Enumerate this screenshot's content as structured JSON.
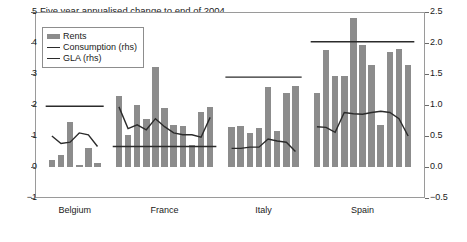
{
  "chart_data": {
    "type": "bar",
    "title": "Five year annualised change to end of 2004",
    "xlabel": "",
    "ylabel": "",
    "ylim": [
      -1,
      5
    ],
    "y2lim": [
      -0.5,
      2.5
    ],
    "yticks": [
      "5",
      "4",
      "3",
      "2",
      "1",
      "0",
      "-1"
    ],
    "ytick_values": [
      5,
      4,
      3,
      2,
      1,
      0,
      -1
    ],
    "y2ticks": [
      "2.5",
      "2.0",
      "1.5",
      "1.0",
      "0.5",
      "0.0",
      "-0.5"
    ],
    "y2tick_values": [
      2.5,
      2.0,
      1.5,
      1.0,
      0.5,
      0.0,
      -0.5
    ],
    "grid": false,
    "legend_position": "top-left",
    "legend": [
      {
        "label": "Rents",
        "type": "bar",
        "color": "#8c8c8c"
      },
      {
        "label": "Consumption (rhs)",
        "type": "line",
        "color": "#2b2b2b"
      },
      {
        "label": "GLA (rhs)",
        "type": "line",
        "color": "#2b2b2b"
      }
    ],
    "categories": [
      "Belgium",
      "France",
      "Italy",
      "Spain"
    ],
    "groups": [
      {
        "name": "Belgium",
        "rents": [
          0.22,
          0.38,
          1.45,
          0.06,
          0.62,
          0.12
        ],
        "consumption_rhs": [
          0.5,
          0.38,
          0.4,
          0.55,
          0.52,
          0.33
        ],
        "gla_rhs": 0.98
      },
      {
        "name": "France",
        "rents": [
          2.28,
          1.02,
          2.0,
          1.55,
          3.22,
          1.9,
          1.35,
          1.33,
          0.72,
          1.78,
          1.92
        ],
        "consumption_rhs": [
          0.97,
          0.62,
          0.68,
          0.6,
          0.78,
          0.65,
          0.55,
          0.52,
          0.52,
          0.48,
          0.8
        ],
        "gla_rhs": 0.33
      },
      {
        "name": "Italy",
        "rents": [
          1.3,
          1.33,
          1.1,
          1.25,
          2.58,
          1.15,
          2.38,
          2.62
        ],
        "consumption_rhs": [
          0.3,
          0.3,
          0.32,
          0.32,
          0.45,
          0.42,
          0.4,
          0.25
        ],
        "gla_rhs": 1.45
      },
      {
        "name": "Spain",
        "rents": [
          2.38,
          3.78,
          2.95,
          2.92,
          4.82,
          3.92,
          3.3,
          1.35,
          3.72,
          3.8,
          3.3
        ],
        "consumption_rhs": [
          0.65,
          0.64,
          0.56,
          0.88,
          0.86,
          0.85,
          0.88,
          0.9,
          0.88,
          0.78,
          0.5
        ],
        "gla_rhs": 2.02
      }
    ]
  }
}
